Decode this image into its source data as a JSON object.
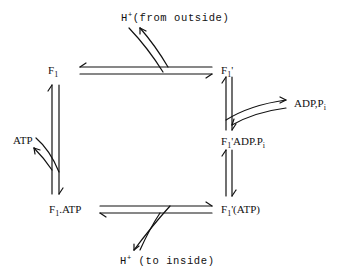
{
  "diagram": {
    "type": "reaction-cycle",
    "nodes": {
      "f1": {
        "base": "F",
        "sub": "1",
        "suffix": ""
      },
      "f1_prime": {
        "base": "F",
        "sub": "1",
        "suffix": "'"
      },
      "f1_prime_adp_pi": {
        "base": "F",
        "sub": "1",
        "suffix": "'ADP.P",
        "suffix_sub": "i"
      },
      "f1_prime_atp": {
        "base": "F",
        "sub": "1",
        "suffix": "'(ATP)"
      },
      "f1_atp": {
        "base": "F",
        "sub": "1",
        "suffix": ".ATP"
      }
    },
    "side_species": {
      "h_from_outside": {
        "base": "H",
        "sup": "+",
        "text": "(from outside)"
      },
      "h_to_inside": {
        "base": "H",
        "sup": "+",
        "text": " (to inside)"
      },
      "adp_pi": {
        "text": "ADP,P",
        "sub": "i"
      },
      "atp": {
        "text": "ATP"
      }
    },
    "edges": [
      {
        "from": "F1",
        "to": "F1'",
        "reversible": true,
        "coupled": "H+ (from outside) enters"
      },
      {
        "from": "F1'",
        "to": "F1'ADP.Pi",
        "reversible": true,
        "coupled": "ADP, Pi bound/released"
      },
      {
        "from": "F1'ADP.Pi",
        "to": "F1'(ATP)",
        "reversible": true
      },
      {
        "from": "F1'(ATP)",
        "to": "F1.ATP",
        "reversible": true,
        "coupled": "H+ (to inside) released"
      },
      {
        "from": "F1.ATP",
        "to": "F1",
        "reversible": true,
        "coupled": "ATP released"
      }
    ],
    "line_color": "#111111"
  }
}
